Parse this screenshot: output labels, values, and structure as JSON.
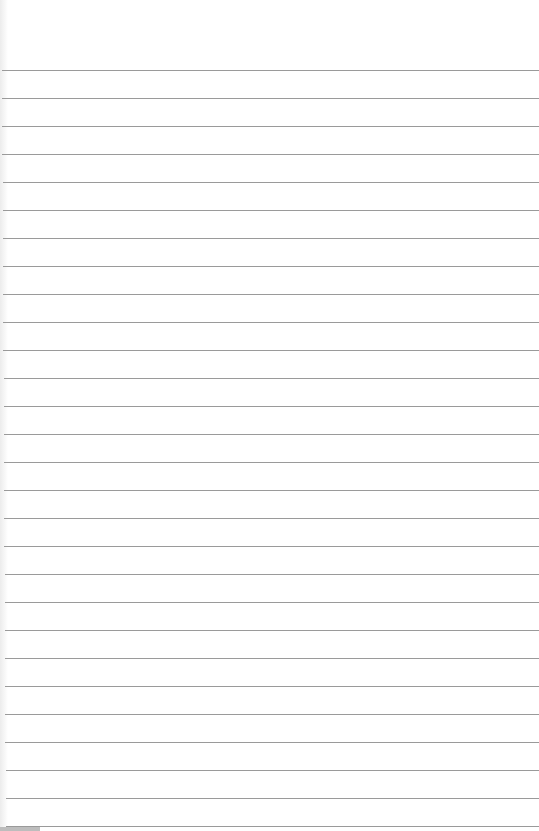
{
  "paper": {
    "type": "lined-paper",
    "background": "#ffffff",
    "line_color": "#9a9a9a",
    "first_line_y": 70,
    "line_spacing": 28,
    "line_count": 28
  }
}
